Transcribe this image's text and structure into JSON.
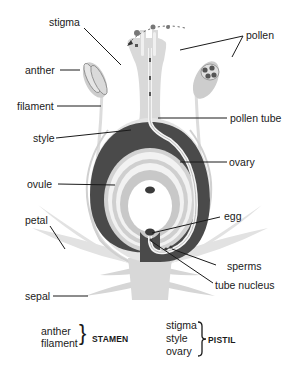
{
  "labels": {
    "stigma": "stigma",
    "pollen": "pollen",
    "anther": "anther",
    "filament": "filament",
    "pollen_tube": "pollen tube",
    "style": "style",
    "ovary": "ovary",
    "ovule": "ovule",
    "egg": "egg",
    "petal": "petal",
    "sperms": "sperms",
    "tube_nucleus": "tube nucleus",
    "sepal": "sepal"
  },
  "legend": {
    "stamen": {
      "items": [
        "anther",
        "filament"
      ],
      "heading": "STAMEN"
    },
    "pistil": {
      "items": [
        "stigma",
        "style",
        "ovary"
      ],
      "heading": "PISTIL"
    }
  },
  "colors": {
    "tissue_light": "#dcdcdc",
    "tissue_mid": "#c4c4c4",
    "ovary_wall": "#4a4a4a",
    "leader_line": "#1a1a1a",
    "background": "#ffffff"
  }
}
